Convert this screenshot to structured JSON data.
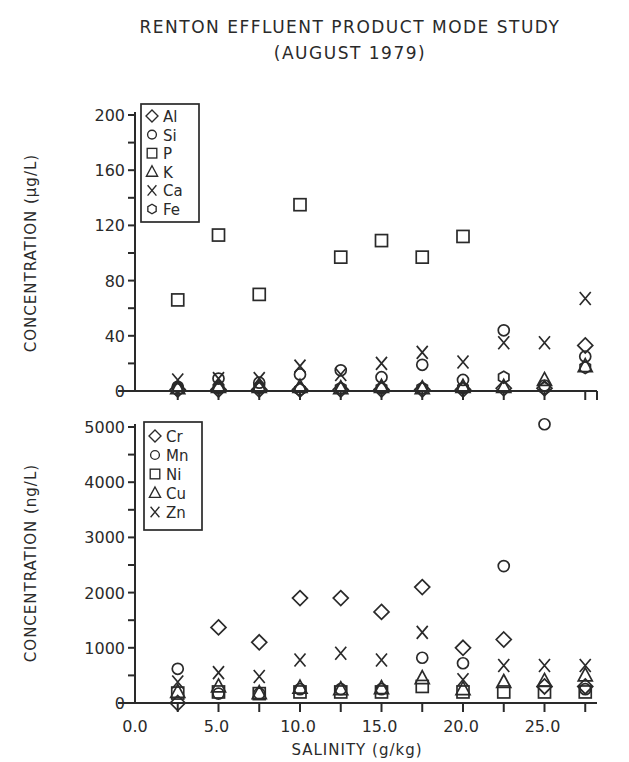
{
  "title": "RENTON EFFLUENT PRODUCT MODE STUDY",
  "subtitle": "(AUGUST 1979)",
  "chart_data": [
    {
      "type": "scatter",
      "title": "RENTON EFFLUENT PRODUCT MODE STUDY (AUGUST 1979)",
      "xlabel": "SALINITY (g/kg)",
      "ylabel": "CONCENTRATION (µg/L)",
      "ylim": [
        0,
        200
      ],
      "yticks": [
        0,
        40,
        80,
        120,
        160,
        200
      ],
      "ytick_labels": [
        "0",
        "40",
        "80",
        "120",
        "160",
        "200"
      ],
      "xlim": [
        0,
        27.5
      ],
      "grid": false,
      "legend_position": "upper-left",
      "x": [
        2.5,
        5.0,
        7.5,
        10.0,
        12.5,
        15.0,
        17.5,
        20.0,
        22.5,
        25.0,
        27.5
      ],
      "series": [
        {
          "name": "Al",
          "marker": "diamond",
          "values": [
            1,
            1,
            1,
            1,
            1,
            1,
            1,
            1,
            2,
            2,
            33
          ]
        },
        {
          "name": "Si",
          "marker": "circle",
          "values": [
            3,
            9,
            6,
            12,
            15,
            10,
            19,
            8,
            44,
            4,
            25
          ]
        },
        {
          "name": "P",
          "marker": "square",
          "values": [
            66,
            113,
            70,
            135,
            97,
            109,
            97,
            112,
            null,
            null,
            null
          ]
        },
        {
          "name": "K",
          "marker": "triangle",
          "values": [
            2,
            3,
            3,
            3,
            2,
            3,
            2,
            3,
            3,
            8,
            18
          ]
        },
        {
          "name": "Ca",
          "marker": "x",
          "values": [
            8,
            9,
            9,
            18,
            12,
            20,
            28,
            21,
            35,
            35,
            67
          ]
        },
        {
          "name": "Fe",
          "marker": "hexagon",
          "values": [
            1,
            2,
            2,
            1,
            2,
            2,
            2,
            2,
            10,
            2,
            17
          ]
        }
      ]
    },
    {
      "type": "scatter",
      "xlabel": "SALINITY (g/kg)",
      "ylabel": "CONCENTRATION (ng/L)",
      "ylim": [
        0,
        5000
      ],
      "yticks": [
        0,
        1000,
        2000,
        3000,
        4000,
        5000
      ],
      "ytick_labels": [
        "0",
        "1000",
        "2000",
        "3000",
        "4000",
        "5000"
      ],
      "xticks": [
        0,
        5,
        10,
        15,
        20,
        25
      ],
      "xtick_labels": [
        "0.0",
        "5.0",
        "10.0",
        "15.0",
        "20.0",
        "25.0"
      ],
      "xlim": [
        0,
        27.5
      ],
      "grid": false,
      "legend_position": "upper-left",
      "x": [
        2.5,
        5.0,
        7.5,
        10.0,
        12.5,
        15.0,
        17.5,
        20.0,
        22.5,
        25.0,
        27.5
      ],
      "series": [
        {
          "name": "Cr",
          "marker": "diamond",
          "values": [
            0,
            1370,
            1100,
            1900,
            1900,
            1650,
            2100,
            1000,
            1150,
            300,
            300
          ]
        },
        {
          "name": "Mn",
          "marker": "circle",
          "values": [
            620,
            170,
            170,
            250,
            250,
            250,
            820,
            720,
            2480,
            5050,
            250
          ]
        },
        {
          "name": "Ni",
          "marker": "square",
          "values": [
            180,
            200,
            170,
            200,
            200,
            200,
            300,
            200,
            200,
            200,
            200
          ]
        },
        {
          "name": "Cu",
          "marker": "triangle",
          "values": [
            200,
            300,
            180,
            280,
            250,
            270,
            450,
            250,
            380,
            400,
            500
          ]
        },
        {
          "name": "Zn",
          "marker": "x",
          "values": [
            380,
            550,
            480,
            780,
            900,
            780,
            1280,
            420,
            680,
            680,
            680
          ]
        }
      ]
    }
  ]
}
